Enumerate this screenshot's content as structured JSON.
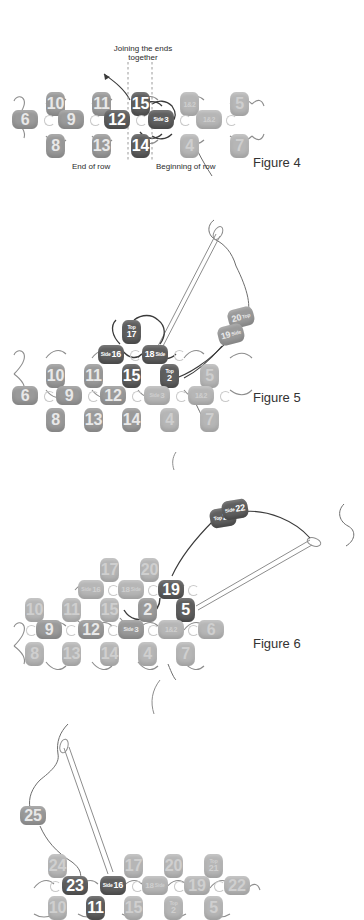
{
  "document": {
    "kind": "beadwork-instruction-diagram",
    "title": "Joining the ends together — beaded band figures"
  },
  "palette": {
    "active_bead": "#5f5f5f",
    "mid_bead": "#9a9a9a",
    "ghost_bead": "#b6b6b6",
    "thread": "#6d6d6d",
    "text": "#2b2b2b",
    "background": "#ffffff"
  },
  "figures": [
    {
      "id": "fig4",
      "caption": "Figure 4",
      "annotations": [
        {
          "name": "joining-note",
          "text_line1": "Joining the ends",
          "text_line2": "together"
        },
        {
          "name": "end-of-row-label",
          "text": "End of row"
        },
        {
          "name": "beginning-of-row-label",
          "text": "Beginning of row"
        }
      ],
      "beads": [
        {
          "label": "10",
          "state": "mid",
          "orient": "v"
        },
        {
          "label": "11",
          "state": "mid",
          "orient": "v"
        },
        {
          "label": "15",
          "state": "active",
          "orient": "v"
        },
        {
          "label": "1&2",
          "state": "ghost",
          "orient": "v"
        },
        {
          "label": "5",
          "state": "ghost",
          "orient": "v"
        },
        {
          "label": "6",
          "state": "mid",
          "orient": "h"
        },
        {
          "label": "9",
          "state": "mid",
          "orient": "h"
        },
        {
          "label": "12",
          "state": "active",
          "orient": "h"
        },
        {
          "label": "3",
          "prefix": "Side",
          "state": "active",
          "orient": "h"
        },
        {
          "label": "1&2",
          "state": "ghost",
          "orient": "h"
        },
        {
          "label": "8",
          "state": "mid",
          "orient": "v"
        },
        {
          "label": "13",
          "state": "mid",
          "orient": "v"
        },
        {
          "label": "14",
          "state": "active",
          "orient": "v"
        },
        {
          "label": "4",
          "state": "ghost",
          "orient": "v"
        },
        {
          "label": "7",
          "state": "ghost",
          "orient": "v"
        }
      ]
    },
    {
      "id": "fig5",
      "caption": "Figure 5",
      "new_beads": [
        {
          "label": "20",
          "prefix": "Top",
          "state": "mid"
        },
        {
          "label": "19",
          "prefix": "Side",
          "state": "mid"
        }
      ],
      "beads": [
        {
          "label": "17",
          "prefix": "Top",
          "state": "active",
          "orient": "v"
        },
        {
          "label": "16",
          "prefix": "Side",
          "state": "active",
          "orient": "h"
        },
        {
          "label": "18",
          "suffix": "Side",
          "state": "active",
          "orient": "h"
        },
        {
          "label": "15",
          "state": "active",
          "orient": "v"
        },
        {
          "label": "2",
          "prefix": "Top",
          "state": "active",
          "orient": "v"
        },
        {
          "label": "10",
          "state": "mid",
          "orient": "v"
        },
        {
          "label": "11",
          "state": "mid",
          "orient": "v"
        },
        {
          "label": "5",
          "state": "ghost",
          "orient": "v"
        },
        {
          "label": "6",
          "state": "mid",
          "orient": "h"
        },
        {
          "label": "9",
          "state": "mid",
          "orient": "h"
        },
        {
          "label": "12",
          "state": "mid",
          "orient": "h"
        },
        {
          "label": "3",
          "prefix": "Side",
          "state": "ghost",
          "orient": "h"
        },
        {
          "label": "1&2",
          "state": "ghost",
          "orient": "h"
        },
        {
          "label": "8",
          "state": "mid",
          "orient": "v"
        },
        {
          "label": "13",
          "state": "mid",
          "orient": "v"
        },
        {
          "label": "14",
          "state": "mid",
          "orient": "v"
        },
        {
          "label": "4",
          "state": "ghost",
          "orient": "v"
        },
        {
          "label": "7",
          "state": "ghost",
          "orient": "v"
        }
      ]
    },
    {
      "id": "fig6",
      "caption": "Figure 6",
      "new_beads": [
        {
          "label": "21",
          "prefix": "Top",
          "state": "active"
        },
        {
          "label": "22",
          "prefix": "Side",
          "state": "active"
        }
      ],
      "beads": [
        {
          "label": "17",
          "state": "ghost",
          "orient": "v"
        },
        {
          "label": "20",
          "state": "ghost",
          "orient": "v"
        },
        {
          "label": "16",
          "prefix": "Side",
          "state": "ghost",
          "orient": "h"
        },
        {
          "label": "18",
          "suffix": "Side",
          "state": "ghost",
          "orient": "h"
        },
        {
          "label": "19",
          "state": "active",
          "orient": "h"
        },
        {
          "label": "10",
          "state": "ghost",
          "orient": "v"
        },
        {
          "label": "11",
          "state": "ghost",
          "orient": "v"
        },
        {
          "label": "15",
          "state": "ghost",
          "orient": "v"
        },
        {
          "label": "2",
          "state": "mid",
          "orient": "v"
        },
        {
          "label": "5",
          "state": "active",
          "orient": "v"
        },
        {
          "label": "9",
          "state": "mid",
          "orient": "h"
        },
        {
          "label": "12",
          "state": "mid",
          "orient": "h"
        },
        {
          "label": "3",
          "prefix": "Side",
          "state": "mid",
          "orient": "h"
        },
        {
          "label": "1&2",
          "state": "ghost",
          "orient": "h"
        },
        {
          "label": "6",
          "state": "ghost",
          "orient": "h"
        },
        {
          "label": "8",
          "state": "ghost",
          "orient": "v"
        },
        {
          "label": "13",
          "state": "ghost",
          "orient": "v"
        },
        {
          "label": "14",
          "state": "ghost",
          "orient": "v"
        },
        {
          "label": "4",
          "state": "ghost",
          "orient": "v"
        },
        {
          "label": "7",
          "state": "ghost",
          "orient": "v"
        }
      ]
    },
    {
      "id": "fig7",
      "caption": "",
      "new_beads": [
        {
          "label": "25",
          "state": "mid"
        }
      ],
      "beads": [
        {
          "label": "24",
          "state": "ghost",
          "orient": "v"
        },
        {
          "label": "23",
          "state": "active",
          "orient": "h"
        },
        {
          "label": "16",
          "prefix": "Side",
          "state": "active",
          "orient": "h"
        },
        {
          "label": "17",
          "state": "ghost",
          "orient": "v"
        },
        {
          "label": "20",
          "state": "ghost",
          "orient": "v"
        },
        {
          "label": "21",
          "prefix": "Top",
          "state": "ghost",
          "orient": "v"
        },
        {
          "label": "18",
          "suffix": "Side",
          "state": "ghost",
          "orient": "h"
        },
        {
          "label": "19",
          "state": "ghost",
          "orient": "h"
        },
        {
          "label": "22",
          "state": "ghost",
          "orient": "h"
        },
        {
          "label": "10",
          "state": "ghost",
          "orient": "v"
        },
        {
          "label": "11",
          "state": "active",
          "orient": "v"
        },
        {
          "label": "15",
          "state": "ghost",
          "orient": "v"
        },
        {
          "label": "2",
          "prefix": "Top",
          "state": "ghost",
          "orient": "v"
        },
        {
          "label": "5",
          "state": "ghost",
          "orient": "v"
        }
      ]
    }
  ]
}
